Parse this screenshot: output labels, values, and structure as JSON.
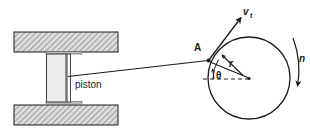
{
  "figure": {
    "type": "slider-crank-mechanism-diagram",
    "background_color": "#ffffff",
    "line_color": "#1a1a1a",
    "hatch_color": "#8c8c8c",
    "piston_fill": "#e8e8e8",
    "block_fill": "#d9d9d9"
  },
  "labels": {
    "piston": "piston",
    "point_a": "A",
    "velocity": "v",
    "velocity_subscript": "t",
    "radius": "r",
    "angle": "θ",
    "rotation": "n"
  },
  "geometry": {
    "cylinder_top_block": {
      "x": 14,
      "y": 32,
      "width": 104,
      "height": 20
    },
    "cylinder_bottom_block": {
      "x": 14,
      "y": 105,
      "width": 104,
      "height": 20
    },
    "piston_body": {
      "x": 46,
      "y": 54,
      "width": 20,
      "height": 49
    },
    "piston_rod_x": 69,
    "crank_circle": {
      "cx": 249,
      "cy": 78,
      "r": 41
    },
    "point_a": {
      "x": 208,
      "y": 60
    },
    "connecting_rod_start": {
      "x": 68,
      "y": 76
    },
    "velocity_arrow_tip": {
      "x": 241,
      "y": 17
    },
    "datum_line_y": 79,
    "theta_degrees": 65
  }
}
